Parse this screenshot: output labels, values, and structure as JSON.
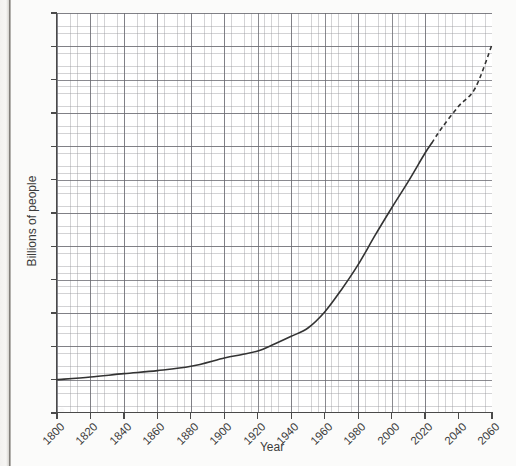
{
  "chart_data": {
    "type": "line",
    "title": "",
    "xlabel": "Year",
    "ylabel": "Billions of people",
    "xlim": [
      1800,
      2060
    ],
    "ylim": [
      0,
      12
    ],
    "xticks": [
      1800,
      1820,
      1840,
      1860,
      1880,
      1900,
      1920,
      1940,
      1960,
      1980,
      2000,
      2020,
      2040,
      2060
    ],
    "yticks": [
      0,
      1,
      2,
      3,
      4,
      5,
      6,
      7,
      8,
      9,
      10,
      11,
      12
    ],
    "xtick_labels": [
      "1800",
      "1820",
      "1840",
      "1860",
      "1880",
      "1900",
      "1920",
      "1940",
      "1960",
      "1980",
      "2000",
      "2020",
      "2040",
      "2060"
    ],
    "ytick_labels": [
      "0",
      "1",
      "2",
      "3",
      "4",
      "5",
      "6",
      "7",
      "8",
      "9",
      "10",
      "11",
      "12"
    ],
    "grid": true,
    "grid_minor": true,
    "grid_minor_per_major": 5,
    "legend": "none",
    "line_color": "#333333",
    "grid_major_color": "#6a6a70",
    "grid_minor_color": "#96969b",
    "axis_color": "#4a4a4a",
    "background": "#ffffff",
    "series": [
      {
        "name": "World population (historical)",
        "style": "solid",
        "x": [
          1800,
          1820,
          1840,
          1860,
          1880,
          1900,
          1910,
          1920,
          1930,
          1940,
          1950,
          1960,
          1970,
          1980,
          1990,
          2000,
          2010,
          2020,
          2024
        ],
        "values": [
          1.0,
          1.08,
          1.18,
          1.27,
          1.4,
          1.65,
          1.75,
          1.86,
          2.07,
          2.3,
          2.55,
          3.03,
          3.7,
          4.45,
          5.32,
          6.15,
          6.95,
          7.8,
          8.1
        ]
      },
      {
        "name": "World population (projected)",
        "style": "dashed",
        "x": [
          2024,
          2030,
          2040,
          2050,
          2060
        ],
        "values": [
          8.1,
          8.55,
          9.2,
          9.75,
          11.05
        ]
      }
    ]
  },
  "axis": {
    "y_label": "Billions of people",
    "x_label": "Year"
  }
}
